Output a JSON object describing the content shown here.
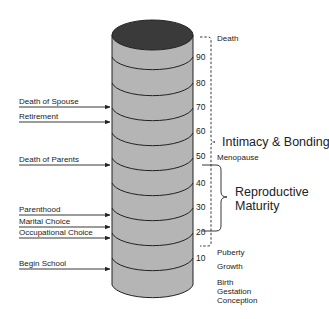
{
  "diagram": {
    "type": "life-cylinder",
    "colors": {
      "cylinder_body": "#b5b5b5",
      "cylinder_top": "#3a3a3a",
      "line": "#222222",
      "background": "#ffffff"
    },
    "age_ticks": [
      {
        "label": "90",
        "y": 57
      },
      {
        "label": "80",
        "y": 83
      },
      {
        "label": "70",
        "y": 107
      },
      {
        "label": "60",
        "y": 131
      },
      {
        "label": "50",
        "y": 156
      },
      {
        "label": "40",
        "y": 183
      },
      {
        "label": "30",
        "y": 207
      },
      {
        "label": "20",
        "y": 232
      },
      {
        "label": "10",
        "y": 258
      }
    ],
    "life_events": [
      {
        "label": "Death of Spouse",
        "y": 107
      },
      {
        "label": "Retirement",
        "y": 122
      },
      {
        "label": "Death of Parents",
        "y": 165
      },
      {
        "label": "Parenthood",
        "y": 215
      },
      {
        "label": "Marital Choice",
        "y": 227
      },
      {
        "label": "Occupational Choice",
        "y": 238
      },
      {
        "label": "Begin School",
        "y": 269
      }
    ],
    "milestones": {
      "death": "Death",
      "menopause": "Menopause",
      "puberty": "Puberty",
      "growth": "Growth",
      "birth": "Birth",
      "gestation": "Gestation",
      "conception": "Conception"
    },
    "phases": {
      "intimacy": "Intimacy & Bonding",
      "reproductive_line1": "Reproductive",
      "reproductive_line2": "Maturity"
    }
  }
}
